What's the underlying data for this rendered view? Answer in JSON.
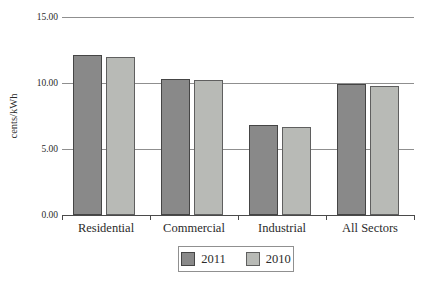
{
  "chart_data": {
    "type": "bar",
    "title": "",
    "xlabel": "",
    "ylabel": "cents/kWh",
    "categories": [
      "Residential",
      "Commercial",
      "Industrial",
      "All Sectors"
    ],
    "series": [
      {
        "name": "2011",
        "color": "#898989",
        "border_color": "#454545",
        "values": [
          12.1,
          10.3,
          6.8,
          9.9
        ]
      },
      {
        "name": "2010",
        "color": "#b8bab6",
        "border_color": "#5f5f5f",
        "values": [
          12.0,
          10.2,
          6.7,
          9.8
        ]
      }
    ],
    "ylim": [
      0,
      15
    ],
    "yticks": [
      0,
      5,
      10,
      15
    ],
    "ytick_labels": [
      "0.00",
      "5.00",
      "10.00",
      "15.00"
    ],
    "grid": true,
    "legend_position": "bottom"
  }
}
